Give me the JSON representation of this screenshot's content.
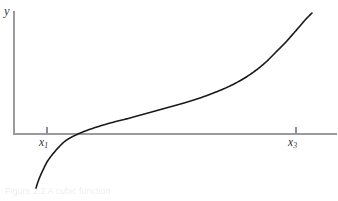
{
  "figure": {
    "background_color": "#ffffff",
    "width": 338,
    "height": 201,
    "caption_remnant": "Figure 2.2  A cubic function"
  },
  "axes": {
    "axis_color": "#9a9a9f",
    "x_axis": {
      "y_pixel": 134,
      "x_start_pixel": 14,
      "x_end_pixel": 337
    },
    "y_axis": {
      "x_pixel": 14,
      "y_start_pixel": 11,
      "y_end_pixel": 134,
      "label": "y"
    },
    "ticks": [
      {
        "name": "x1",
        "label": "x",
        "subscript": "1",
        "x_pixel": 47
      },
      {
        "name": "x3",
        "label": "x",
        "subscript": "3",
        "x_pixel": 296
      }
    ]
  },
  "chart_data": {
    "type": "line",
    "title": "",
    "xlabel": "",
    "ylabel": "y",
    "grid": false,
    "legend": null,
    "curve_color": "#1a1a1a",
    "curve_width": 1.6,
    "x_tick_labels": [
      "x1",
      "x3"
    ],
    "x_tick_pixels": [
      47,
      296
    ],
    "axis_crossing_x_pixel": 78,
    "series": [
      {
        "name": "curve",
        "points_pixel": [
          [
            36,
            188
          ],
          [
            39,
            179
          ],
          [
            43,
            170
          ],
          [
            47,
            162
          ],
          [
            52,
            155
          ],
          [
            58,
            148
          ],
          [
            64,
            142
          ],
          [
            70,
            138
          ],
          [
            78,
            134
          ],
          [
            88,
            130
          ],
          [
            100,
            126
          ],
          [
            114,
            122
          ],
          [
            130,
            118
          ],
          [
            148,
            113
          ],
          [
            166,
            108
          ],
          [
            184,
            103
          ],
          [
            200,
            98
          ],
          [
            216,
            92
          ],
          [
            230,
            86
          ],
          [
            243,
            79
          ],
          [
            255,
            71
          ],
          [
            266,
            62
          ],
          [
            276,
            52
          ],
          [
            285,
            43
          ],
          [
            293,
            34
          ],
          [
            300,
            26
          ],
          [
            306,
            19
          ],
          [
            312,
            13
          ]
        ]
      }
    ]
  }
}
